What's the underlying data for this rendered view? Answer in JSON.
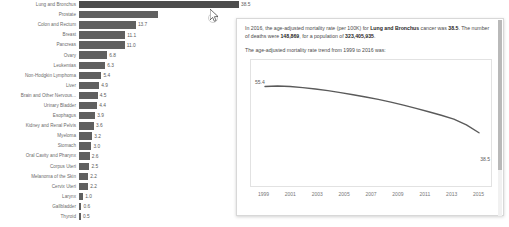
{
  "chart_data": [
    {
      "type": "bar",
      "orientation": "horizontal",
      "title": "",
      "xlabel": "",
      "ylabel": "",
      "xlim": [
        0,
        38.5
      ],
      "grid": false,
      "categories": [
        "Lung and Bronchus",
        "Prostate",
        "Colon and Rectum",
        "Breast",
        "Pancreas",
        "Ovary",
        "Leukemias",
        "Non-Hodgkin Lymphoma",
        "Liver",
        "Brain and Other Nervous...",
        "Urinary Bladder",
        "Esophagus",
        "Kidney and Renal Pelvis",
        "Myeloma",
        "Stomach",
        "Oral Cavity and Pharynx",
        "Corpus Uteri",
        "Melanoma of the Skin",
        "Cervix Uteri",
        "Larynx",
        "Gallbladder",
        "Thyroid"
      ],
      "values": [
        38.5,
        18.9,
        13.7,
        11.1,
        11.0,
        6.8,
        6.3,
        5.4,
        4.9,
        4.5,
        4.4,
        3.9,
        3.6,
        3.2,
        3.0,
        2.6,
        2.5,
        2.2,
        2.2,
        1.0,
        0.6,
        0.5
      ],
      "labels": [
        "38.5",
        "",
        "13.7",
        "11.1",
        "11.0",
        "6.8",
        "6.3",
        "5.4",
        "4.9",
        "4.5",
        "4.4",
        "3.9",
        "3.6",
        "3.2",
        "3.0",
        "2.6",
        "2.5",
        "2.2",
        "2.2",
        "1.0",
        "0.6",
        "0.5"
      ],
      "bar_color": "#606060",
      "highlight_index": 0
    },
    {
      "type": "line",
      "title": "",
      "xlabel": "",
      "ylabel": "",
      "grid": false,
      "x": [
        1999,
        2000,
        2001,
        2002,
        2003,
        2004,
        2005,
        2006,
        2007,
        2008,
        2009,
        2010,
        2011,
        2012,
        2013,
        2014,
        2015,
        2016
      ],
      "y": [
        55.4,
        55.6,
        55.4,
        55.0,
        54.5,
        53.9,
        53.2,
        52.4,
        51.6,
        50.7,
        49.7,
        48.6,
        47.4,
        46.2,
        44.9,
        43.5,
        41.4,
        38.5
      ],
      "tick_labels": [
        "1999",
        "2001",
        "2003",
        "2005",
        "2007",
        "2009",
        "2011",
        "2013",
        "2015"
      ],
      "start_label": "55.4",
      "end_label": "38.5",
      "line_color": "#5a5a5a",
      "ylim": [
        30,
        60
      ],
      "xlim": [
        1999,
        2016
      ]
    }
  ],
  "tooltip": {
    "paragraph1": {
      "p1": "In 2016, the age-adjusted mortality rate (per 100K) for ",
      "b1": "Lung and Bronchus",
      "p2": " cancer was ",
      "b2": "38.5",
      "p3": ". The number of deaths were ",
      "b3": "148,869",
      "p4": ", for a population of ",
      "b4": "323,405,935",
      "p5": "."
    },
    "paragraph2": "The age-adjusted mortality rate trend from 1999 to 2016 was:"
  },
  "colors": {
    "bar": "#606060",
    "line": "#5a5a5a",
    "panel_border": "#d8d8d8",
    "text": "#4a4a4a"
  }
}
